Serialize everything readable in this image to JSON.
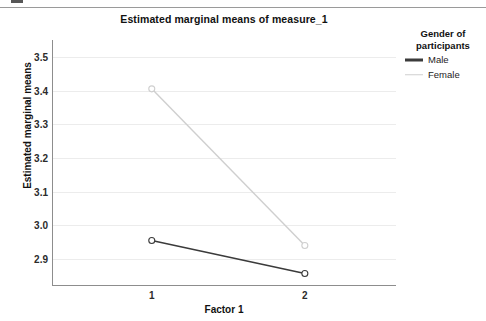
{
  "chart_data": {
    "type": "line",
    "title": "Estimated marginal means of measure_1",
    "xlabel": "Factor 1",
    "ylabel": "Estimated marginal means",
    "categories": [
      "1",
      "2"
    ],
    "xtick_labels": [
      "1",
      "2"
    ],
    "ytick_labels": [
      "2.9",
      "3.0",
      "3.1",
      "3.2",
      "3.3",
      "3.4",
      "3.5"
    ],
    "ytick_values": [
      2.9,
      3.0,
      3.1,
      3.2,
      3.3,
      3.4,
      3.5
    ],
    "ylim": [
      2.82,
      3.55
    ],
    "grid": true,
    "grid_axis": "y",
    "legend_position": "right",
    "legend_title": "Gender of participants",
    "series": [
      {
        "name": "Male",
        "values": [
          2.955,
          2.857
        ],
        "color": "#3b3b3b",
        "line_width": 1.6,
        "marker": "circle-open"
      },
      {
        "name": "Female",
        "values": [
          3.405,
          2.94
        ],
        "color": "#cfcfcf",
        "line_width": 1.4,
        "marker": "circle-open"
      }
    ]
  },
  "legend": {
    "title_line1": "Gender of",
    "title_line2": "participants",
    "entries": [
      {
        "label": "Male",
        "color": "#3b3b3b",
        "thickness": "3px"
      },
      {
        "label": "Female",
        "color": "#cfcfcf",
        "thickness": "1.5px"
      }
    ]
  },
  "colors": {
    "background": "#ffffff",
    "axis": "#8d8d8d",
    "gridline": "#ececec",
    "text": "#111111",
    "male": "#3b3b3b",
    "female": "#cfcfcf"
  }
}
